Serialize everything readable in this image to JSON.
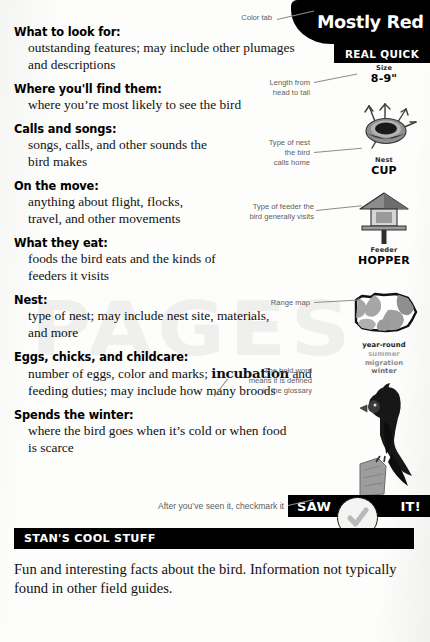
{
  "page": {
    "watermark_text": "PAGES"
  },
  "color_tab": {
    "label": "Mostly Red",
    "callout": "Color tab",
    "bg_color": "#000000",
    "text_color": "#ffffff"
  },
  "real_quick": {
    "label": "REAL QUICK"
  },
  "rail": {
    "size": {
      "caption": "Size",
      "value": "8-9\"",
      "callout": "Length from\nhead to tail",
      "icon": "ruler-icon"
    },
    "nest": {
      "caption": "Nest",
      "value": "CUP",
      "callout": "Type of nest\nthe bird\ncalls home",
      "icon": "cup-nest-icon"
    },
    "feeder": {
      "caption": "Feeder",
      "value": "HOPPER",
      "callout": "Type of feeder the\nbird generally visits",
      "icon": "hopper-feeder-icon"
    },
    "range_map": {
      "callout": "Range map",
      "icon": "range-map-icon",
      "legend": [
        {
          "label": "year-round",
          "color": "#1b1b1b"
        },
        {
          "label": "summer",
          "color": "#a8a8a8"
        },
        {
          "label": "migration",
          "color": "#8a8a8a"
        },
        {
          "label": "winter",
          "color": "#6d6d6d"
        }
      ]
    },
    "bird_photo": {
      "icon": "cardinal-bird-icon"
    }
  },
  "entries": [
    {
      "heading": "What to look for:",
      "body": "outstanding features; may include other plumages and descriptions"
    },
    {
      "heading": "Where you'll find them:",
      "body": "where you’re most likely to see the bird"
    },
    {
      "heading": "Calls and songs:",
      "body": "songs, calls, and other sounds the bird makes"
    },
    {
      "heading": "On the move:",
      "body": "anything about flight, flocks, travel, and other movements"
    },
    {
      "heading": "What they eat:",
      "body": "foods the bird eats and the kinds of feeders it visits"
    },
    {
      "heading": "Nest:",
      "body": "type of nest; may include nest site, materials, and more"
    },
    {
      "heading": "Eggs, chicks, and childcare:",
      "body_pre": "number of eggs, color and marks; ",
      "body_bold": "incubation",
      "body_post": " and feeding duties; may include how many broods"
    },
    {
      "heading": "Spends the winter:",
      "body": "where the bird goes when it’s cold or when food is scarce"
    }
  ],
  "glossary_callout": {
    "text": "The bold word\nmeans it is defined\nin the glossary"
  },
  "saw_it": {
    "left_label": "SAW",
    "right_label": "IT!",
    "callout": "After you’ve seen it, checkmark it",
    "check_icon": "checkmark-icon"
  },
  "stans": {
    "banner": "STAN'S COOL STUFF",
    "body": "Fun and interesting facts about the bird. Information not typically found in other field guides."
  }
}
